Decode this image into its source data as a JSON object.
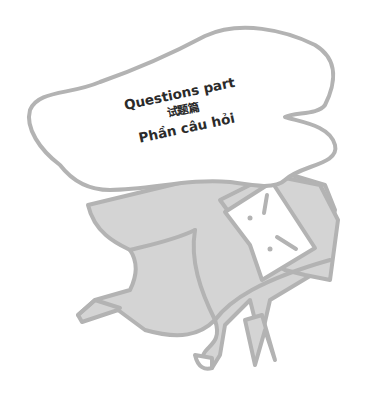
{
  "bubble": {
    "line1": "Questions part",
    "line2": "试题篇",
    "line3": "Phần câu hỏi"
  },
  "colors": {
    "outline": "#b3b3b3",
    "figure_fill": "#d4d4d4",
    "bubble_fill": "#ffffff",
    "text": "#2b2b2b"
  },
  "illustration": {
    "subject": "figure-carrying-speech-bubble-icon"
  }
}
